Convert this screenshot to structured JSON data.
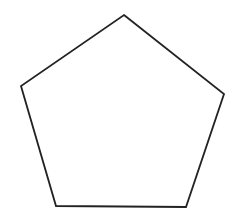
{
  "canvas": {
    "width": 236,
    "height": 215,
    "background_color": "#ffffff"
  },
  "figure": {
    "name": "pentagon",
    "shape_type": "regular-pentagon",
    "sides": 5,
    "fill": "none",
    "fill_color": "#ffffff",
    "stroke_color": "#222222",
    "stroke_width": 1.8,
    "orientation": "apex-up",
    "vertices": [
      {
        "label": "apex-top",
        "x": 124,
        "y": 15
      },
      {
        "label": "upper-right",
        "x": 224,
        "y": 94
      },
      {
        "label": "lower-right",
        "x": 186,
        "y": 207
      },
      {
        "label": "lower-left",
        "x": 56,
        "y": 206
      },
      {
        "label": "upper-left",
        "x": 21,
        "y": 86
      }
    ],
    "points_attr": "124,15 224,94 186,207 56,206 21,86"
  }
}
